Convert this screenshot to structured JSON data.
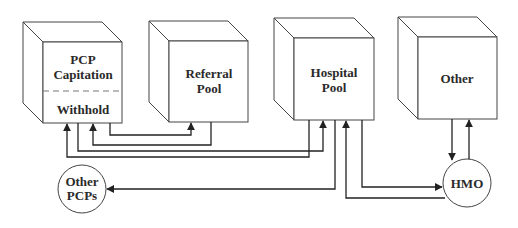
{
  "diagram": {
    "nodes": {
      "pcp": {
        "line1": "PCP",
        "line2": "Capitation",
        "line3": "Withhold"
      },
      "referral": {
        "line1": "Referral",
        "line2": "Pool"
      },
      "hospital": {
        "line1": "Hospital",
        "line2": "Pool"
      },
      "other": {
        "line1": "Other"
      },
      "other_pcps": {
        "line1": "Other",
        "line2": "PCPs"
      },
      "hmo": {
        "line1": "HMO"
      }
    },
    "edges": [
      {
        "from": "Referral Pool",
        "to": "PCP Withhold"
      },
      {
        "from": "PCP Withhold",
        "to": "Referral Pool"
      },
      {
        "from": "PCP Withhold",
        "to": "Hospital Pool"
      },
      {
        "from": "Hospital Pool",
        "to": "PCP Withhold"
      },
      {
        "from": "Hospital Pool",
        "to": "Other PCPs"
      },
      {
        "from": "HMO",
        "to": "Hospital Pool"
      },
      {
        "from": "Hospital Pool",
        "to": "HMO"
      },
      {
        "from": "Other",
        "to": "HMO"
      },
      {
        "from": "HMO",
        "to": "Other"
      }
    ]
  }
}
